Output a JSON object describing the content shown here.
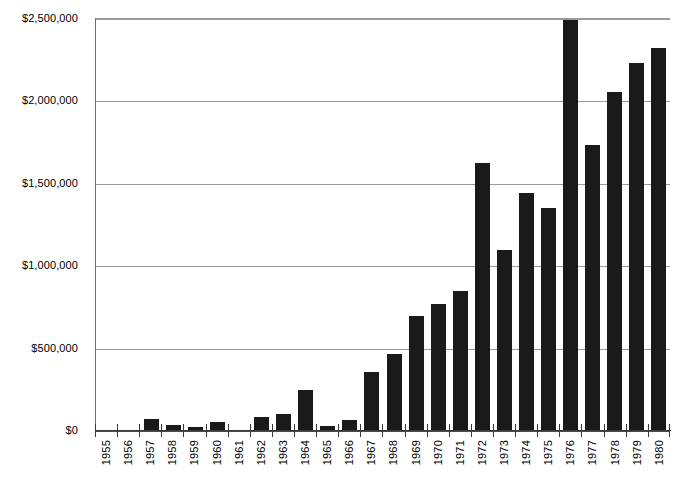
{
  "chart_data": {
    "type": "bar",
    "title": "",
    "subtitle": "",
    "xlabel": "",
    "ylabel": "",
    "ylim": [
      0,
      2500000
    ],
    "grid": true,
    "legend": "none",
    "orientation": "vertical",
    "bar_color": "#1a1a1a",
    "gridline_color": "#9a9a9a",
    "axis_color": "#3a3a3a",
    "y_ticks": [
      0,
      500000,
      1000000,
      1500000,
      2000000,
      2500000
    ],
    "y_tick_labels": [
      "$0",
      "$500,000",
      "$1,000,000",
      "$1,500,000",
      "$2,000,000",
      "$2,500,000"
    ],
    "categories": [
      "1955",
      "1956",
      "1957",
      "1958",
      "1959",
      "1960",
      "1961",
      "1962",
      "1963",
      "1964",
      "1965",
      "1966",
      "1967",
      "1968",
      "1969",
      "1970",
      "1971",
      "1972",
      "1973",
      "1974",
      "1975",
      "1976",
      "1977",
      "1978",
      "1979",
      "1980"
    ],
    "values": [
      0,
      0,
      65000,
      30000,
      18000,
      50000,
      0,
      80000,
      100000,
      245000,
      25000,
      60000,
      355000,
      460000,
      690000,
      765000,
      845000,
      1620000,
      1090000,
      1440000,
      1350000,
      2490000,
      1730000,
      2050000,
      2230000,
      2320000
    ],
    "x_tick_label_rotation": -90
  }
}
